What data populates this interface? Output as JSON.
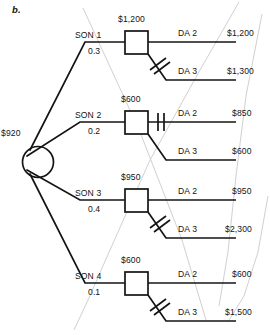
{
  "figure": {
    "label": "b.",
    "type": "decision-tree"
  },
  "root": {
    "node_type": "chance-circle",
    "value": "$920"
  },
  "branches": [
    {
      "state_label": "SON 1",
      "probability": "0.3",
      "decision_node_value": "$1,200",
      "options": [
        {
          "label": "DA 2",
          "payoff": "$1,200",
          "pruned": false
        },
        {
          "label": "DA 3",
          "payoff": "$1,300",
          "pruned": true
        }
      ]
    },
    {
      "state_label": "SON 2",
      "probability": "0.2",
      "decision_node_value": "$600",
      "options": [
        {
          "label": "DA 2",
          "payoff": "$850",
          "pruned": true
        },
        {
          "label": "DA 3",
          "payoff": "$600",
          "pruned": false
        }
      ]
    },
    {
      "state_label": "SON 3",
      "probability": "0.4",
      "decision_node_value": "$950",
      "options": [
        {
          "label": "DA 2",
          "payoff": "$950",
          "pruned": false
        },
        {
          "label": "DA 3",
          "payoff": "$2,300",
          "pruned": true
        }
      ]
    },
    {
      "state_label": "SON 4",
      "probability": "0.1",
      "decision_node_value": "$600",
      "options": [
        {
          "label": "DA 2",
          "payoff": "$600",
          "pruned": false
        },
        {
          "label": "DA 3",
          "payoff": "$1,500",
          "pruned": true
        }
      ]
    }
  ],
  "colors": {
    "ink": "#141414",
    "paper": "#ffffff",
    "bleed_through": "#c9c9c9"
  }
}
